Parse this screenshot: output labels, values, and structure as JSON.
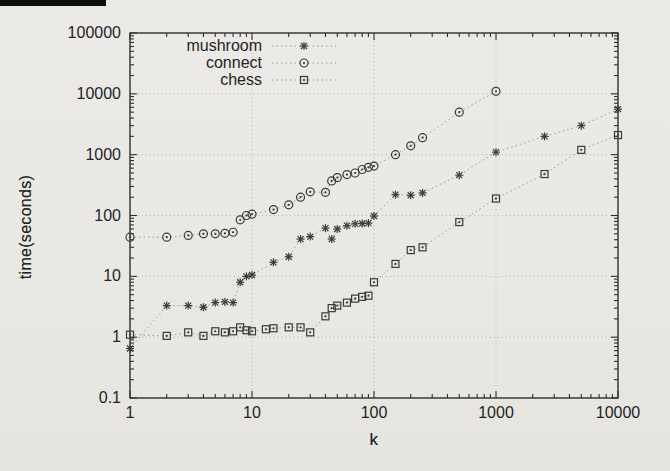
{
  "figure": {
    "kind": "scanned-plot",
    "scan_artifact": "black-bar-top-left"
  },
  "colors": {
    "background": "#eae8e4",
    "text": "#242424",
    "border": "#2f2f2f",
    "grid": "#a6a6a4",
    "series_line": "#9a9a98",
    "marker": "#3a3a3a",
    "artifact_bar": "#0d0d0d"
  },
  "chart_data": {
    "type": "line",
    "subtype": "log-log scatter with dotted connecting lines",
    "title": "",
    "xlabel": "k",
    "ylabel": "time(seconds)",
    "xscale": "log",
    "yscale": "log",
    "xlim": [
      1,
      10000
    ],
    "ylim": [
      0.1,
      100000
    ],
    "x_ticks": [
      "1",
      "10",
      "100",
      "1000",
      "10000"
    ],
    "y_ticks": [
      "0.1",
      "1",
      "10",
      "100",
      "1000",
      "10000",
      "100000"
    ],
    "grid": true,
    "legend_position": "top-left-inside",
    "series": [
      {
        "name": "mushroom",
        "marker": "asterisk",
        "points": [
          [
            1,
            0.65
          ],
          [
            2,
            3.3
          ],
          [
            3,
            3.3
          ],
          [
            4,
            3.1
          ],
          [
            5,
            3.7
          ],
          [
            6,
            3.8
          ],
          [
            7,
            3.7
          ],
          [
            8,
            8
          ],
          [
            9,
            10
          ],
          [
            10,
            10.5
          ],
          [
            15,
            17
          ],
          [
            20,
            21
          ],
          [
            25,
            41
          ],
          [
            30,
            45
          ],
          [
            40,
            62
          ],
          [
            45,
            41
          ],
          [
            50,
            60
          ],
          [
            60,
            68
          ],
          [
            70,
            73
          ],
          [
            80,
            74
          ],
          [
            90,
            75
          ],
          [
            100,
            98
          ],
          [
            150,
            220
          ],
          [
            200,
            215
          ],
          [
            250,
            235
          ],
          [
            500,
            460
          ],
          [
            1000,
            1100
          ],
          [
            2500,
            2000
          ],
          [
            5000,
            3000
          ],
          [
            10000,
            5600
          ]
        ]
      },
      {
        "name": "connect",
        "marker": "circle",
        "points": [
          [
            1,
            44
          ],
          [
            2,
            44
          ],
          [
            3,
            47
          ],
          [
            4,
            50
          ],
          [
            5,
            50
          ],
          [
            6,
            51
          ],
          [
            7,
            53
          ],
          [
            8,
            85
          ],
          [
            9,
            100
          ],
          [
            10,
            105
          ],
          [
            15,
            125
          ],
          [
            20,
            150
          ],
          [
            25,
            200
          ],
          [
            30,
            245
          ],
          [
            40,
            240
          ],
          [
            45,
            370
          ],
          [
            50,
            420
          ],
          [
            60,
            470
          ],
          [
            70,
            500
          ],
          [
            80,
            570
          ],
          [
            90,
            620
          ],
          [
            100,
            650
          ],
          [
            150,
            1000
          ],
          [
            200,
            1400
          ],
          [
            250,
            1900
          ],
          [
            500,
            5000
          ],
          [
            1000,
            11000
          ]
        ]
      },
      {
        "name": "chess",
        "marker": "square",
        "points": [
          [
            1,
            1.1
          ],
          [
            2,
            1.05
          ],
          [
            3,
            1.2
          ],
          [
            4,
            1.05
          ],
          [
            5,
            1.25
          ],
          [
            6,
            1.2
          ],
          [
            7,
            1.25
          ],
          [
            8,
            1.45
          ],
          [
            9,
            1.3
          ],
          [
            10,
            1.25
          ],
          [
            13,
            1.35
          ],
          [
            15,
            1.4
          ],
          [
            20,
            1.45
          ],
          [
            25,
            1.45
          ],
          [
            30,
            1.2
          ],
          [
            40,
            2.2
          ],
          [
            45,
            3.0
          ],
          [
            50,
            3.3
          ],
          [
            60,
            3.7
          ],
          [
            70,
            4.3
          ],
          [
            80,
            4.6
          ],
          [
            90,
            4.8
          ],
          [
            100,
            8
          ],
          [
            150,
            16
          ],
          [
            200,
            27
          ],
          [
            250,
            30
          ],
          [
            500,
            78
          ],
          [
            1000,
            190
          ],
          [
            2500,
            480
          ],
          [
            5000,
            1200
          ],
          [
            10000,
            2100
          ]
        ]
      }
    ]
  }
}
